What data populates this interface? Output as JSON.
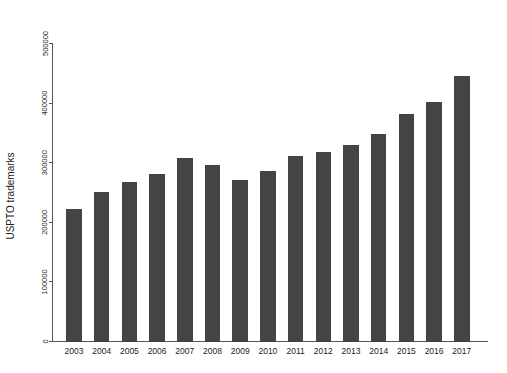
{
  "chart_data": {
    "type": "bar",
    "title": "",
    "subtitle": "",
    "xlabel": "",
    "ylabel": "USPTO trademarks",
    "categories": [
      "2003",
      "2004",
      "2005",
      "2006",
      "2007",
      "2008",
      "2009",
      "2010",
      "2011",
      "2012",
      "2013",
      "2014",
      "2015",
      "2016",
      "2017"
    ],
    "values": [
      223000,
      251000,
      267000,
      281000,
      308000,
      296000,
      271000,
      286000,
      311000,
      318000,
      329000,
      348000,
      381000,
      402000,
      445000
    ],
    "ylim": [
      0,
      500000
    ],
    "ytick_values": [
      0,
      100000,
      200000,
      300000,
      400000,
      500000
    ],
    "ytick_labels": [
      "0",
      "100000",
      "200000",
      "300000",
      "400000",
      "500000"
    ],
    "grid": false,
    "legend": null,
    "legend_position": "none",
    "bar_color": "#444444",
    "axis_color": "#555555",
    "background_color": "#ffffff",
    "annotations": []
  }
}
